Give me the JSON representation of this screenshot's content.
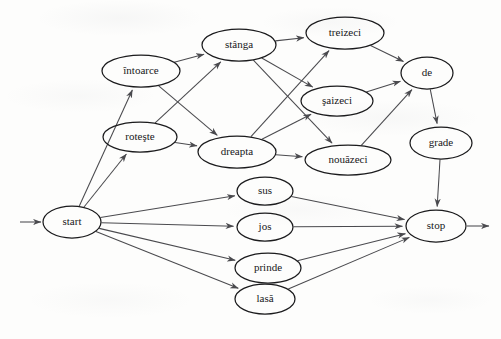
{
  "diagram": {
    "type": "directed-graph",
    "colors": {
      "background": "#fdfdfc",
      "node_stroke": "#1b1b1d",
      "edge_stroke": "#4a4a4e",
      "label_text": "#17171a"
    },
    "nodes": [
      {
        "id": "start",
        "label": "start",
        "cx": 72,
        "cy": 222,
        "rx": 29,
        "ry": 16
      },
      {
        "id": "intoarce",
        "label": "întoarce",
        "cx": 141,
        "cy": 71,
        "rx": 39,
        "ry": 16
      },
      {
        "id": "roteste",
        "label": "roteşte",
        "cx": 140,
        "cy": 137,
        "rx": 37,
        "ry": 15
      },
      {
        "id": "stanga",
        "label": "stânga",
        "cx": 239,
        "cy": 45,
        "rx": 37,
        "ry": 16
      },
      {
        "id": "dreapta",
        "label": "dreapta",
        "cx": 237,
        "cy": 152,
        "rx": 39,
        "ry": 16
      },
      {
        "id": "treizeci",
        "label": "treizeci",
        "cx": 345,
        "cy": 33,
        "rx": 39,
        "ry": 16
      },
      {
        "id": "saizeci",
        "label": "şaizeci",
        "cx": 337,
        "cy": 101,
        "rx": 36,
        "ry": 15
      },
      {
        "id": "nouazeci",
        "label": "nouăzeci",
        "cx": 348,
        "cy": 160,
        "rx": 43,
        "ry": 15
      },
      {
        "id": "de",
        "label": "de",
        "cx": 427,
        "cy": 73,
        "rx": 26,
        "ry": 16
      },
      {
        "id": "grade",
        "label": "grade",
        "cx": 441,
        "cy": 143,
        "rx": 31,
        "ry": 16
      },
      {
        "id": "sus",
        "label": "sus",
        "cx": 265,
        "cy": 191,
        "rx": 28,
        "ry": 14
      },
      {
        "id": "jos",
        "label": "jos",
        "cx": 265,
        "cy": 227,
        "rx": 28,
        "ry": 14
      },
      {
        "id": "prinde",
        "label": "prinde",
        "cx": 268,
        "cy": 268,
        "rx": 33,
        "ry": 15
      },
      {
        "id": "lasa",
        "label": "lasă",
        "cx": 265,
        "cy": 299,
        "rx": 30,
        "ry": 15
      },
      {
        "id": "stop",
        "label": "stop",
        "cx": 436,
        "cy": 226,
        "rx": 30,
        "ry": 16
      }
    ],
    "edges": [
      {
        "from": "entry",
        "to": "start"
      },
      {
        "from": "start",
        "to": "intoarce"
      },
      {
        "from": "start",
        "to": "roteste"
      },
      {
        "from": "start",
        "to": "sus"
      },
      {
        "from": "start",
        "to": "jos"
      },
      {
        "from": "start",
        "to": "prinde"
      },
      {
        "from": "start",
        "to": "lasa"
      },
      {
        "from": "intoarce",
        "to": "stanga"
      },
      {
        "from": "intoarce",
        "to": "dreapta"
      },
      {
        "from": "roteste",
        "to": "stanga"
      },
      {
        "from": "roteste",
        "to": "dreapta"
      },
      {
        "from": "stanga",
        "to": "treizeci"
      },
      {
        "from": "stanga",
        "to": "saizeci"
      },
      {
        "from": "stanga",
        "to": "nouazeci"
      },
      {
        "from": "dreapta",
        "to": "treizeci"
      },
      {
        "from": "dreapta",
        "to": "saizeci"
      },
      {
        "from": "dreapta",
        "to": "nouazeci"
      },
      {
        "from": "treizeci",
        "to": "de"
      },
      {
        "from": "saizeci",
        "to": "de"
      },
      {
        "from": "nouazeci",
        "to": "de"
      },
      {
        "from": "de",
        "to": "grade"
      },
      {
        "from": "grade",
        "to": "stop"
      },
      {
        "from": "sus",
        "to": "stop"
      },
      {
        "from": "jos",
        "to": "stop"
      },
      {
        "from": "prinde",
        "to": "stop"
      },
      {
        "from": "lasa",
        "to": "stop"
      },
      {
        "from": "stop",
        "to": "exit"
      }
    ],
    "entry_arrow": {
      "x1": 20,
      "y1": 222,
      "x2": 41,
      "y2": 222
    },
    "exit_arrow": {
      "x1": 467,
      "y1": 226,
      "x2": 489,
      "y2": 226
    }
  }
}
